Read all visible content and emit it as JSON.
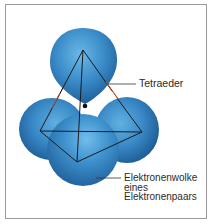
{
  "figure": {
    "colors": {
      "sphere_base": "#3a8cc8",
      "sphere_highlight": "#6bb8e8",
      "sphere_shadow": "#1f5f9a",
      "edge_front": "#1a1a1a",
      "edge_gap": "#c0502a",
      "frame": "#9a9a9a",
      "text": "#2b2b2b"
    },
    "labels": {
      "tetraeder": "Tetraeder",
      "cloud_line1": "Elektronenwolke",
      "cloud_line2": "eines",
      "cloud_line3": "Elektronenpaars"
    },
    "tetrahedron_vertices": {
      "apex": [
        83,
        50
      ],
      "left": [
        40,
        131
      ],
      "right": [
        142,
        132
      ],
      "bottom": [
        77,
        162
      ],
      "center": [
        85,
        106
      ]
    }
  }
}
